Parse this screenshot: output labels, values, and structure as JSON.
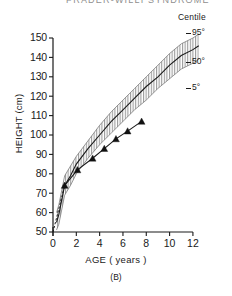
{
  "figure": {
    "title_partial": "PRADER-WILLI SYNDROME",
    "panel_letter": "(B)"
  },
  "legend": {
    "title": "Centile",
    "items": [
      {
        "label": "95°",
        "name": "centile-95"
      },
      {
        "label": "50°",
        "name": "centile-50"
      },
      {
        "label": "5°",
        "name": "centile-5"
      }
    ]
  },
  "axes": {
    "y_label": "HEIGHT (cm)",
    "x_label": "AGE ( years )",
    "y_ticks": [
      "50",
      "60",
      "70",
      "80",
      "90",
      "100",
      "110",
      "120",
      "130",
      "140",
      "150"
    ],
    "x_ticks": [
      "0",
      "2",
      "4",
      "6",
      "8",
      "10",
      "12"
    ]
  },
  "chart_data": {
    "type": "line",
    "title": "PRADER-WILLI SYNDROME",
    "xlabel": "AGE ( years )",
    "ylabel": "HEIGHT (cm)",
    "xlim": [
      0,
      12
    ],
    "ylim": [
      50,
      150
    ],
    "x_ticks": [
      0,
      2,
      4,
      6,
      8,
      10,
      12
    ],
    "y_ticks": [
      50,
      60,
      70,
      80,
      90,
      100,
      110,
      120,
      130,
      140,
      150
    ],
    "grid": false,
    "legend_position": "right",
    "legend_title": "Centile",
    "series": [
      {
        "name": "95°",
        "style": "band-upper-hatched",
        "x": [
          0.3,
          0.5,
          1,
          1.5,
          2,
          3,
          4,
          5,
          6,
          7,
          8,
          9,
          10,
          11,
          12,
          12.5
        ],
        "values": [
          60,
          64,
          79,
          84,
          89,
          97,
          105,
          112,
          118,
          124,
          130,
          136,
          142,
          147,
          150,
          152
        ]
      },
      {
        "name": "50°",
        "style": "solid-line",
        "x": [
          0.3,
          0.5,
          1,
          1.5,
          2,
          3,
          4,
          5,
          6,
          7,
          8,
          9,
          10,
          11,
          12,
          12.5
        ],
        "values": [
          55,
          59,
          74,
          79,
          85,
          93,
          100,
          107,
          113,
          119,
          125,
          130,
          136,
          141,
          144,
          146
        ]
      },
      {
        "name": "5°",
        "style": "band-lower-hatched",
        "x": [
          0.3,
          0.5,
          1,
          1.5,
          2,
          3,
          4,
          5,
          6,
          7,
          8,
          9,
          10,
          11,
          12,
          12.5
        ],
        "values": [
          51,
          54,
          69,
          74,
          80,
          88,
          95,
          101,
          107,
          113,
          118,
          124,
          129,
          134,
          137,
          139
        ]
      },
      {
        "name": "patient",
        "style": "line-with-triangle-markers",
        "x": [
          1.0,
          2.1,
          3.4,
          4.4,
          5.4,
          6.4,
          7.6
        ],
        "values": [
          74,
          82,
          88,
          93,
          98,
          102,
          107
        ]
      }
    ],
    "annotations": [
      {
        "text": "dashed extrapolation near origin",
        "x_range": [
          0,
          0.9
        ]
      }
    ]
  }
}
